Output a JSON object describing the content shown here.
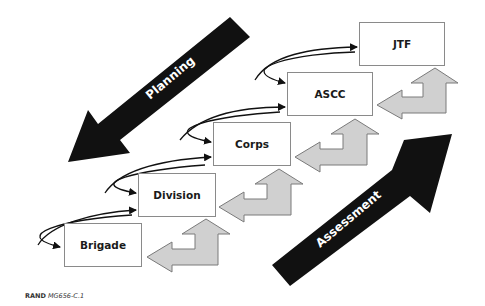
{
  "diagram": {
    "boxes": [
      {
        "id": "brigade",
        "label": "Brigade"
      },
      {
        "id": "division",
        "label": "Division"
      },
      {
        "id": "corps",
        "label": "Corps"
      },
      {
        "id": "ascc",
        "label": "ASCC"
      },
      {
        "id": "jtf",
        "label": "JTF"
      }
    ],
    "planning_arrow": {
      "label": "Planning",
      "direction": "down-left"
    },
    "assessment_arrow": {
      "label": "Assessment",
      "direction": "up-right"
    },
    "colors": {
      "dark_arrow": "#111111",
      "gray_arrow_fill": "#d0d0d0",
      "gray_arrow_stroke": "#7a7a7a",
      "box_border": "#8a8a8a"
    }
  },
  "credit": {
    "org": "RAND",
    "id": "MG656-C.1"
  }
}
